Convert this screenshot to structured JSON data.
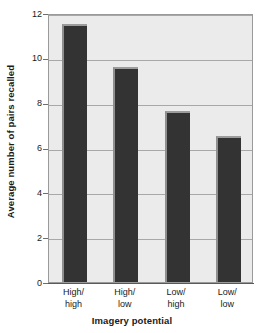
{
  "chart_data": {
    "type": "bar",
    "title": "",
    "subtitle": "",
    "xlabel": "Imagery potential",
    "ylabel": "Average number of pairs recalled",
    "categories": [
      "High/high",
      "High/low",
      "Low/high",
      "Low/low"
    ],
    "category_lines": [
      [
        "High/",
        "high"
      ],
      [
        "High/",
        "low"
      ],
      [
        "Low/",
        "high"
      ],
      [
        "Low/",
        "low"
      ]
    ],
    "values": [
      11.5,
      9.6,
      7.65,
      6.5
    ],
    "ylim": [
      0,
      12
    ],
    "yticks": [
      0,
      2,
      4,
      6,
      8,
      10,
      12
    ],
    "ytick_labels": [
      "0",
      "2",
      "4",
      "6",
      "8",
      "10",
      "12"
    ],
    "grid": true,
    "grid_axis": "y",
    "legend": false,
    "legend_position": "none",
    "bar_color": "#333333",
    "bar_highlight_color": "#9c9c9c",
    "plot_background": "#ebebeb",
    "gridline_color": "#a8a8a8",
    "axis_color": "#5a5a5a",
    "text_color": "#1a1a1a"
  }
}
